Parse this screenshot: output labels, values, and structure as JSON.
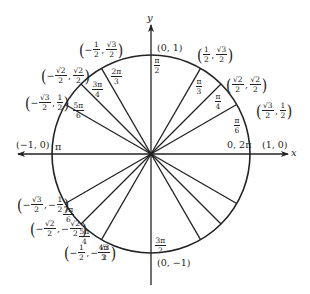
{
  "diagram": {
    "center": {
      "x": 151,
      "y": 154
    },
    "radius": 99,
    "colors": {
      "line": "#222222",
      "background": "#ffffff"
    },
    "axes": {
      "x_label": "x",
      "y_label": "y"
    },
    "angles": [
      {
        "id": "0",
        "deg": 0,
        "angle_label": "0, 2π",
        "point": "(1, 0)"
      },
      {
        "id": "pi6",
        "deg": 30,
        "angle_num": "π",
        "angle_den": "6",
        "point_x_num": "√3",
        "point_x_den": "2",
        "point_x_sign": "",
        "point_y_num": "1",
        "point_y_den": "2",
        "point_y_sign": ""
      },
      {
        "id": "pi4",
        "deg": 45,
        "angle_num": "π",
        "angle_den": "4",
        "point_x_num": "√2",
        "point_x_den": "2",
        "point_x_sign": "",
        "point_y_num": "√2",
        "point_y_den": "2",
        "point_y_sign": ""
      },
      {
        "id": "pi3",
        "deg": 60,
        "angle_num": "π",
        "angle_den": "3",
        "point_x_num": "1",
        "point_x_den": "2",
        "point_x_sign": "",
        "point_y_num": "√3",
        "point_y_den": "2",
        "point_y_sign": ""
      },
      {
        "id": "pi2",
        "deg": 90,
        "angle_num": "π",
        "angle_den": "2",
        "point": "(0, 1)"
      },
      {
        "id": "2pi3",
        "deg": 120,
        "angle_num": "2π",
        "angle_den": "3",
        "point_x_num": "1",
        "point_x_den": "2",
        "point_x_sign": "−",
        "point_y_num": "√3",
        "point_y_den": "2",
        "point_y_sign": ""
      },
      {
        "id": "3pi4",
        "deg": 135,
        "angle_num": "3π",
        "angle_den": "4",
        "point_x_num": "√2",
        "point_x_den": "2",
        "point_x_sign": "−",
        "point_y_num": "√2",
        "point_y_den": "2",
        "point_y_sign": ""
      },
      {
        "id": "5pi6",
        "deg": 150,
        "angle_num": "5π",
        "angle_den": "6",
        "point_x_num": "√3",
        "point_x_den": "2",
        "point_x_sign": "−",
        "point_y_num": "1",
        "point_y_den": "2",
        "point_y_sign": ""
      },
      {
        "id": "pi",
        "deg": 180,
        "angle_label": "π",
        "point": "(−1, 0)"
      },
      {
        "id": "7pi6",
        "deg": 210,
        "angle_num": "7π",
        "angle_den": "6",
        "point_x_num": "√3",
        "point_x_den": "2",
        "point_x_sign": "−",
        "point_y_num": "1",
        "point_y_den": "2",
        "point_y_sign": "−"
      },
      {
        "id": "5pi4",
        "deg": 225,
        "angle_num": "5π",
        "angle_den": "4",
        "point_x_num": "√2",
        "point_x_den": "2",
        "point_x_sign": "−",
        "point_y_num": "√2",
        "point_y_den": "2",
        "point_y_sign": "−"
      },
      {
        "id": "4pi3",
        "deg": 240,
        "angle_num": "4π",
        "angle_den": "3",
        "point_x_num": "1",
        "point_x_den": "2",
        "point_x_sign": "−",
        "point_y_num": "√3",
        "point_y_den": "2",
        "point_y_sign": "−"
      },
      {
        "id": "3pi2",
        "deg": 270,
        "angle_num": "3π",
        "angle_den": "2",
        "point": "(0, −1)"
      },
      {
        "id": "5pi3",
        "deg": 300
      },
      {
        "id": "7pi4",
        "deg": 315
      },
      {
        "id": "11pi6",
        "deg": 330
      }
    ]
  }
}
